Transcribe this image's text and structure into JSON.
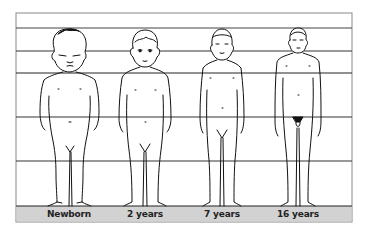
{
  "figures": [
    {
      "id": "newborn",
      "label": "Newborn",
      "heads_tall": 4
    },
    {
      "id": "2-years",
      "label": "2 years",
      "heads_tall": 5
    },
    {
      "id": "7-years",
      "label": "7 years",
      "heads_tall": 6
    },
    {
      "id": "16-years",
      "label": "16 years",
      "heads_tall": 7
    }
  ],
  "grid": {
    "horizontal_divisions": 8,
    "band_color": "#d0d0d0",
    "line_color": "#333333"
  }
}
